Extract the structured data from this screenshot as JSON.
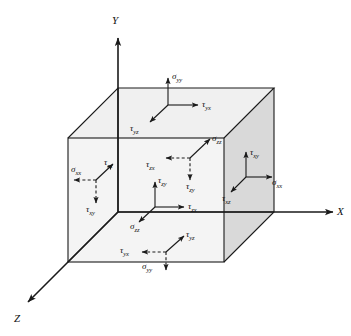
{
  "figure": {
    "background_color": "#ffffff",
    "line_color": "#1a1a1a",
    "face_shade_light": "#f2f2f2",
    "face_shade_dark": "#d9d9d9"
  },
  "axes": [
    {
      "name": "y-axis",
      "label": "Y",
      "direction": "up"
    },
    {
      "name": "x-axis",
      "label": "X",
      "direction": "right"
    },
    {
      "name": "z-axis",
      "label": "Z",
      "direction": "down-left"
    }
  ],
  "stress_groups": [
    {
      "name": "top-face",
      "face": "top (+y)",
      "arrow_style": "solid",
      "components": [
        {
          "symbol": "σ",
          "sub": "yy",
          "direction": "up"
        },
        {
          "symbol": "τ",
          "sub": "yx",
          "direction": "right"
        },
        {
          "symbol": "τ",
          "sub": "yz",
          "direction": "down-left"
        }
      ]
    },
    {
      "name": "back-face",
      "face": "back (-z)",
      "arrow_style": "dashed",
      "components": [
        {
          "symbol": "σ",
          "sub": "zz",
          "direction": "up-right"
        },
        {
          "symbol": "τ",
          "sub": "zx",
          "direction": "left"
        },
        {
          "symbol": "τ",
          "sub": "zy",
          "direction": "down"
        }
      ]
    },
    {
      "name": "front-face",
      "face": "front (+z)",
      "arrow_style": "solid",
      "components": [
        {
          "symbol": "τ",
          "sub": "zy",
          "direction": "up"
        },
        {
          "symbol": "τ",
          "sub": "zx",
          "direction": "right"
        },
        {
          "symbol": "σ",
          "sub": "zz",
          "direction": "down-left"
        }
      ]
    },
    {
      "name": "left-face",
      "face": "left (-x)",
      "arrow_style": "dashed",
      "components": [
        {
          "symbol": "σ",
          "sub": "xx",
          "direction": "left"
        },
        {
          "symbol": "τ",
          "sub": "xz",
          "direction": "up-right"
        },
        {
          "symbol": "τ",
          "sub": "xy",
          "direction": "down"
        }
      ]
    },
    {
      "name": "right-face",
      "face": "right (+x)",
      "arrow_style": "solid",
      "components": [
        {
          "symbol": "τ",
          "sub": "xy",
          "direction": "up"
        },
        {
          "symbol": "σ",
          "sub": "xx",
          "direction": "right"
        },
        {
          "symbol": "τ",
          "sub": "xz",
          "direction": "down-left"
        }
      ]
    },
    {
      "name": "bottom-face",
      "face": "bottom (-y)",
      "arrow_style": "dashed",
      "components": [
        {
          "symbol": "τ",
          "sub": "yz",
          "direction": "up-right"
        },
        {
          "symbol": "τ",
          "sub": "yx",
          "direction": "left"
        },
        {
          "symbol": "σ",
          "sub": "yy",
          "direction": "down"
        }
      ]
    }
  ],
  "labels": {
    "axis_y": "Y",
    "axis_x": "X",
    "axis_z": "Z",
    "sigma": "σ",
    "tau": "τ",
    "top_sigma_yy": "yy",
    "top_tau_yx": "yx",
    "top_tau_yz": "yz",
    "back_sigma_zz": "zz",
    "back_tau_zx": "zx",
    "back_tau_zy": "zy",
    "front_tau_zy": "zy",
    "front_tau_zx": "zx",
    "front_sigma_zz": "zz",
    "left_sigma_xx": "xx",
    "left_tau_xz": "xz",
    "left_tau_xy": "xy",
    "right_tau_xy": "xy",
    "right_sigma_xx": "xx",
    "right_tau_xz": "xz",
    "bottom_tau_yz": "yz",
    "bottom_tau_yx": "yx",
    "bottom_sigma_yy": "yy"
  }
}
